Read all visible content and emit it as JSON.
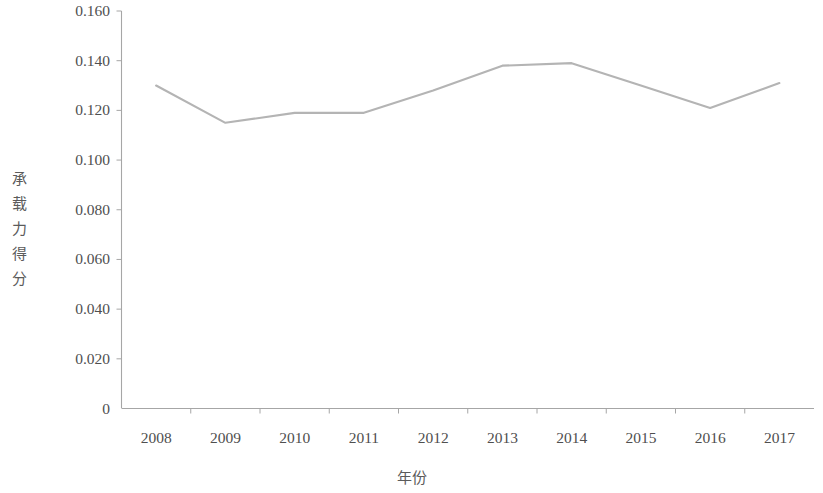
{
  "chart_data": {
    "type": "line",
    "title": "",
    "xlabel": "年份",
    "ylabel": "承载力得分",
    "categories": [
      "2008",
      "2009",
      "2010",
      "2011",
      "2012",
      "2013",
      "2014",
      "2015",
      "2016",
      "2017"
    ],
    "values": [
      0.13,
      0.115,
      0.119,
      0.119,
      0.128,
      0.138,
      0.139,
      0.13,
      0.121,
      0.131
    ],
    "series": [
      {
        "name": "承载力得分",
        "values": [
          0.13,
          0.115,
          0.119,
          0.119,
          0.128,
          0.138,
          0.139,
          0.13,
          0.121,
          0.131
        ]
      }
    ],
    "ylim": [
      0,
      0.16
    ],
    "ytick_values": [
      0,
      0.02,
      0.04,
      0.06,
      0.08,
      0.1,
      0.12,
      0.14,
      0.16
    ],
    "ytick_labels": [
      "0",
      "0.020",
      "0.040",
      "0.060",
      "0.080",
      "0.100",
      "0.120",
      "0.140",
      "0.160"
    ],
    "xtick_labels": [
      "2008",
      "2009",
      "2010",
      "2011",
      "2012",
      "2013",
      "2014",
      "2015",
      "2016",
      "2017"
    ],
    "grid": false,
    "legend": null,
    "legend_position": "none",
    "line_color": "#b4b4b4",
    "axis_color": "#9a9a9a",
    "marker": "none"
  },
  "axes": {
    "y_title_text": "承载力得分",
    "x_title_text": "年份"
  }
}
